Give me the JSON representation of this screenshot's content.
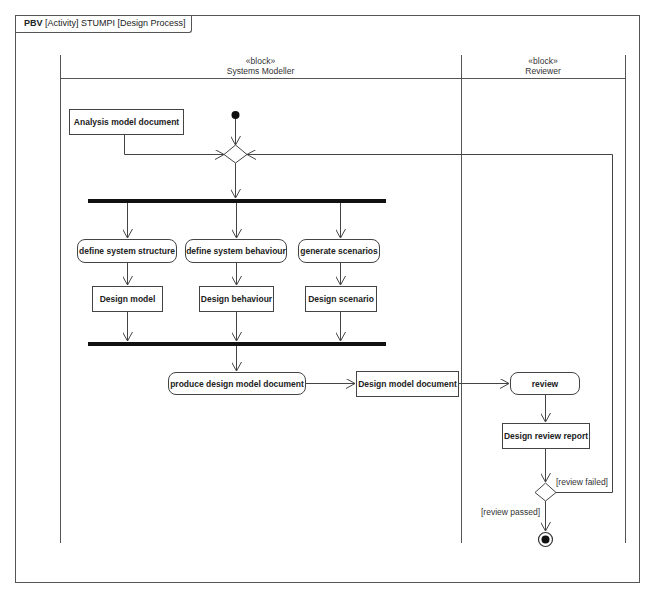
{
  "frame": {
    "kind": "PBV",
    "title": "[Activity] STUMPI [Design Process]"
  },
  "lanes": [
    {
      "stereotype": "«block»",
      "name": "Systems Modeller"
    },
    {
      "stereotype": "«block»",
      "name": "Reviewer"
    }
  ],
  "nodes": {
    "analysis_doc": "Analysis model document",
    "define_structure": "define system structure",
    "define_behaviour": "define system behaviour",
    "generate_scenarios": "generate scenarios",
    "design_model": "Design model",
    "design_behaviour": "Design behaviour",
    "design_scenario": "Design scenario",
    "produce_doc": "produce design model document",
    "design_model_doc": "Design model document",
    "review": "review",
    "design_review_report": "Design review report"
  },
  "guards": {
    "failed": "[review failed]",
    "passed": "[review passed]"
  },
  "colors": {
    "line": "#444444",
    "bar": "#111111"
  }
}
